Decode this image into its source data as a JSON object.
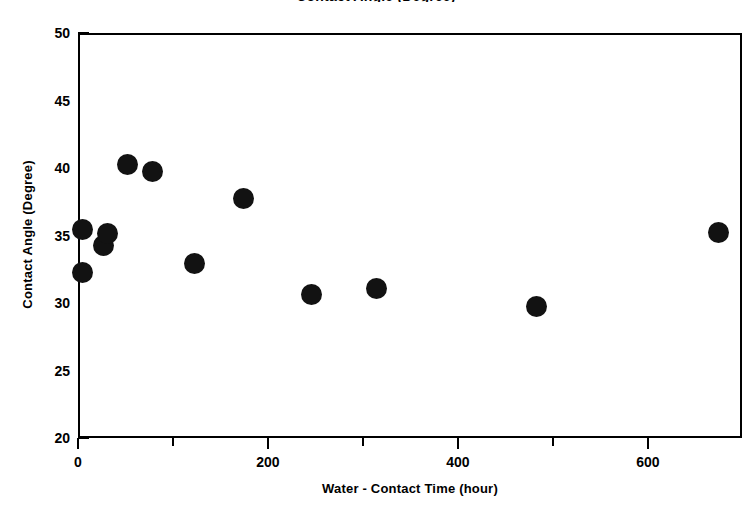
{
  "chart_data": {
    "type": "scatter",
    "title": "Contact Angle (Degree)",
    "xlabel": "Water - Contact Time (hour)",
    "ylabel": "Contact Angle (Degree)",
    "xlim": [
      0,
      699
    ],
    "ylim": [
      20,
      50
    ],
    "x_ticks": [
      0,
      200,
      400,
      600
    ],
    "x_tick_labels": [
      "0",
      "200",
      "400",
      "600"
    ],
    "x_minor_ticks": [
      100,
      300,
      500,
      700
    ],
    "y_ticks": [
      20,
      25,
      30,
      35,
      40,
      45,
      50
    ],
    "y_tick_labels": [
      "20",
      "25",
      "30",
      "35",
      "40",
      "45",
      "50"
    ],
    "grid": false,
    "legend": false,
    "marker": "filled-circle",
    "marker_color": "#121212",
    "marker_size_px": 21,
    "x": [
      3,
      3,
      25,
      29,
      50,
      76,
      121,
      172,
      244,
      312,
      481,
      672
    ],
    "y": [
      35.6,
      32.4,
      34.4,
      35.3,
      40.4,
      39.9,
      33.1,
      37.9,
      30.8,
      31.2,
      29.9,
      35.4
    ],
    "points": [
      {
        "x": 3,
        "y": 35.6
      },
      {
        "x": 3,
        "y": 32.4
      },
      {
        "x": 25,
        "y": 34.4
      },
      {
        "x": 29,
        "y": 35.3
      },
      {
        "x": 50,
        "y": 40.4
      },
      {
        "x": 76,
        "y": 39.9
      },
      {
        "x": 121,
        "y": 33.1
      },
      {
        "x": 172,
        "y": 37.9
      },
      {
        "x": 244,
        "y": 30.8
      },
      {
        "x": 312,
        "y": 31.2
      },
      {
        "x": 481,
        "y": 29.9
      },
      {
        "x": 672,
        "y": 35.4
      }
    ]
  },
  "axes": {
    "frame_color": "#000000",
    "background": "#ffffff"
  }
}
